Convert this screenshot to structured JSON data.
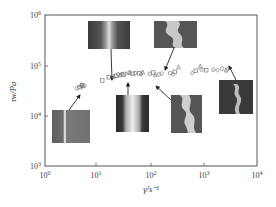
{
  "chart_data": {
    "type": "scatter",
    "title": "",
    "xlabel": "γ̇/s⁻¹",
    "ylabel": "τw/Pa",
    "xscale": "log",
    "yscale": "log",
    "xlim": [
      1,
      10000
    ],
    "ylim": [
      1000,
      1000000
    ],
    "x_ticks": [
      "10^0",
      "10^1",
      "10^2",
      "10^3",
      "10^4"
    ],
    "y_ticks": [
      "10^3",
      "10^4",
      "10^5",
      "10^6"
    ],
    "grid": false,
    "legend": null,
    "series": [
      {
        "name": "squares",
        "marker": "square",
        "points": [
          [
            4.5,
            37000
          ],
          [
            5.0,
            40000
          ],
          [
            12,
            50000
          ],
          [
            16,
            58000
          ],
          [
            22,
            62000
          ],
          [
            30,
            65000
          ],
          [
            45,
            68000
          ],
          [
            60,
            70000
          ],
          [
            110,
            72000
          ],
          [
            280,
            74000
          ],
          [
            700,
            78000
          ],
          [
            1100,
            80000
          ]
        ]
      },
      {
        "name": "circles",
        "marker": "circle",
        "points": [
          [
            4.0,
            35000
          ],
          [
            5.5,
            39000
          ],
          [
            24,
            66000
          ],
          [
            32,
            68000
          ],
          [
            50,
            70000
          ],
          [
            95,
            68000
          ],
          [
            140,
            66000
          ],
          [
            230,
            70000
          ],
          [
            900,
            82000
          ],
          [
            1500,
            82000
          ],
          [
            2200,
            86000
          ]
        ]
      },
      {
        "name": "triangles",
        "marker": "triangle",
        "points": [
          [
            4.8,
            41000
          ],
          [
            20,
            60000
          ],
          [
            26,
            64000
          ],
          [
            40,
            72000
          ],
          [
            70,
            73000
          ],
          [
            120,
            65000
          ],
          [
            330,
            92000
          ],
          [
            850,
            96000
          ],
          [
            2600,
            80000
          ]
        ]
      },
      {
        "name": "diamonds",
        "marker": "diamond",
        "points": [
          [
            5.2,
            38000
          ],
          [
            28,
            67000
          ],
          [
            38,
            71000
          ],
          [
            65,
            67000
          ],
          [
            160,
            69000
          ],
          [
            260,
            66000
          ],
          [
            600,
            70000
          ],
          [
            1800,
            80000
          ],
          [
            2800,
            84000
          ]
        ]
      }
    ],
    "annotations": [
      {
        "type": "inset-image",
        "description": "smooth extrudate with straight stripe",
        "target": [
          4.5,
          37000
        ]
      },
      {
        "type": "inset-image",
        "description": "striped smooth extrudate",
        "target": [
          20,
          62000
        ]
      },
      {
        "type": "inset-image",
        "description": "slightly distorted extrudate",
        "target": [
          25,
          66000
        ]
      },
      {
        "type": "inset-image",
        "description": "helical/wavy distorted extrudate",
        "target": [
          60,
          70000
        ]
      },
      {
        "type": "inset-image",
        "description": "bulky helical extrudate",
        "target": [
          70,
          72000
        ]
      },
      {
        "type": "inset-image",
        "description": "gross melt fracture extrudate",
        "target": [
          2600,
          80000
        ]
      }
    ]
  },
  "axes": {
    "x_label": "γ̇/s⁻¹",
    "y_label": "τw/Pa",
    "x_tick_labels": [
      "10⁰",
      "10¹",
      "10²",
      "10³",
      "10⁴"
    ],
    "y_tick_labels": [
      "10³",
      "10⁴",
      "10⁵",
      "10⁶"
    ]
  }
}
